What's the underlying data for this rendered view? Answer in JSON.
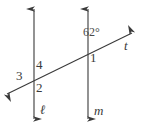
{
  "figure": {
    "type": "geometry-diagram",
    "stroke_color": "#3a3a3a",
    "background_color": "#ffffff"
  },
  "lines": {
    "parallel_left": {
      "label": "ℓ",
      "orientation": "vertical",
      "x": 34,
      "y_top": 8,
      "y_bottom": 120,
      "arrow_top": true,
      "arrow_bottom": true
    },
    "parallel_right": {
      "label": "m",
      "orientation": "vertical",
      "x": 88,
      "y_top": 8,
      "y_bottom": 120,
      "arrow_top": true,
      "arrow_bottom": true
    },
    "transversal": {
      "label": "t",
      "orientation": "diagonal",
      "x_start": 6,
      "y_start": 95,
      "x_end": 133,
      "y_end": 33,
      "arrow_start": true,
      "arrow_end": true
    }
  },
  "angles": [
    {
      "id": "angle-1",
      "label": "1",
      "position": "right-of-m-below-transversal",
      "x": 90,
      "y": 52
    },
    {
      "id": "angle-2",
      "label": "2",
      "position": "right-of-l-below-transversal",
      "x": 36,
      "y": 81
    },
    {
      "id": "angle-3",
      "label": "3",
      "position": "left-of-l-below-transversal",
      "x": 16,
      "y": 70
    },
    {
      "id": "angle-4",
      "label": "4",
      "position": "right-of-l-above-transversal",
      "x": 36,
      "y": 59
    },
    {
      "id": "angle-62",
      "label": "62°",
      "position": "left-of-m-above-transversal",
      "x": 83,
      "y": 27
    }
  ],
  "line_labels": [
    {
      "id": "label-l",
      "text": "ℓ",
      "x": 40,
      "y": 104
    },
    {
      "id": "label-m",
      "text": "m",
      "x": 94,
      "y": 105
    },
    {
      "id": "label-t",
      "text": "t",
      "x": 124,
      "y": 40
    }
  ]
}
